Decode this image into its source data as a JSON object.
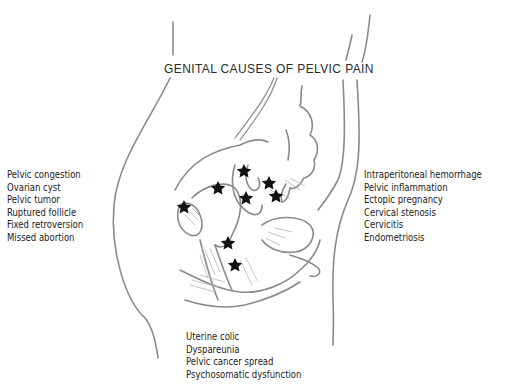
{
  "figure": {
    "title": "GENITAL CAUSES OF PELVIC PAIN",
    "marker_icon": "star-icon",
    "marker_color": "#111111",
    "line_color": "#8a8a8a"
  },
  "left_causes": {
    "items": [
      "Pelvic congestion",
      "Ovarian cyst",
      "Pelvic tumor",
      "Ruptured follicle",
      "Fixed retroversion",
      "Missed abortion"
    ]
  },
  "right_causes": {
    "items": [
      "Intraperitoneal hemorrhage",
      "Pelvic inflammation",
      "Ectopic pregnancy",
      "Cervical stenosis",
      "Cervicitis",
      "Endometriosis"
    ]
  },
  "bottom_causes": {
    "items": [
      "Uterine colic",
      "Dyspareunia",
      "Pelvic cancer spread",
      "Psychosomatic dysfunction"
    ]
  }
}
